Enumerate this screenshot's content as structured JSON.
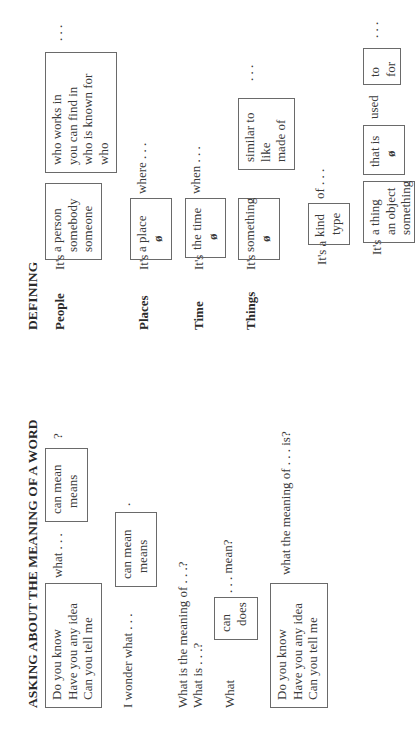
{
  "asking": {
    "heading": "ASKING ABOUT THE MEANING OF A WORD",
    "row1": {
      "box_openers": [
        "Do you know",
        "Have you any idea",
        "Can you tell me"
      ],
      "connector": "what . . .",
      "box_verbs": [
        "can mean",
        "means"
      ],
      "end": "?"
    },
    "row2": {
      "lead": "I wonder what . . .",
      "box_verbs": [
        "can mean",
        "means"
      ],
      "end": "."
    },
    "row3": {
      "line1": "What is the meaning of . . .?",
      "line2": "What is . . .?"
    },
    "row4": {
      "lead": "What",
      "box_aux": [
        "can",
        "does"
      ],
      "end": ". . . mean?"
    },
    "row5": {
      "box_openers": [
        "Do you know",
        "Have you any idea",
        "Can you tell me"
      ],
      "tail": "what the meaning of . . . is?"
    }
  },
  "defining": {
    "heading": "DEFINING",
    "people": {
      "label": "People",
      "its": "It's",
      "box_nouns": [
        "a person",
        "somebody",
        "someone"
      ],
      "box_clauses": [
        "who works in",
        "you can find in",
        "who is known for",
        "who"
      ],
      "end": ". . ."
    },
    "places": {
      "label": "Places",
      "its": "It's",
      "box_nouns": [
        "a place",
        "ø"
      ],
      "tail": "where . . ."
    },
    "time": {
      "label": "Time",
      "its": "It's",
      "box_nouns": [
        "the time",
        "ø"
      ],
      "tail": "when . . ."
    },
    "things": {
      "label": "Things",
      "its": "It's",
      "box_nouns": [
        "something",
        "ø"
      ],
      "box_relations": [
        "similar to",
        "like",
        "made of"
      ],
      "end": ". . .",
      "kind_row": {
        "lead": "It's a",
        "box": [
          "kind",
          "type"
        ],
        "tail": "of . . ."
      },
      "used_row": {
        "its": "It's",
        "box_nouns": [
          "a thing",
          "an object",
          "something"
        ],
        "box_that": [
          "that is",
          "ø"
        ],
        "used": "used",
        "box_prep": [
          "to",
          "for"
        ],
        "end": ". . ."
      }
    }
  }
}
